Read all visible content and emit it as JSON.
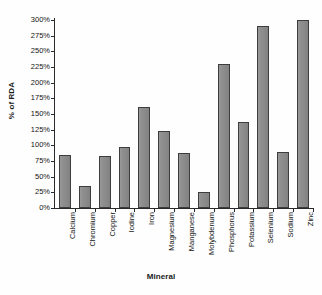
{
  "chart_data": {
    "type": "bar",
    "title": "",
    "xlabel": "Mineral",
    "ylabel": "% of RDA",
    "categories": [
      "Calcium",
      "Chromium",
      "Copper",
      "Iodine",
      "Iron",
      "Magnesium",
      "Manganese",
      "Molybdenum",
      "Phosphorus",
      "Potassium",
      "Selenium",
      "Sodium",
      "Zinc"
    ],
    "values": [
      84,
      35,
      83,
      97,
      161,
      123,
      88,
      25,
      230,
      137,
      291,
      89,
      304
    ],
    "ylim": [
      0,
      300
    ],
    "ytick_step": 25,
    "ytick_labels": [
      "0%",
      "25%",
      "50%",
      "75%",
      "100%",
      "125%",
      "150%",
      "175%",
      "200%",
      "225%",
      "250%",
      "275%",
      "300%"
    ],
    "ytick_values": [
      0,
      25,
      50,
      75,
      100,
      125,
      150,
      175,
      200,
      225,
      250,
      275,
      300
    ],
    "grid": false,
    "legend": false,
    "legend_position": "none",
    "bar_fill_color": "#8f8f8f",
    "bar_border_color": "#3d3d3d",
    "axis_color": "#2a2a2a",
    "background_color": "#ffffff"
  }
}
